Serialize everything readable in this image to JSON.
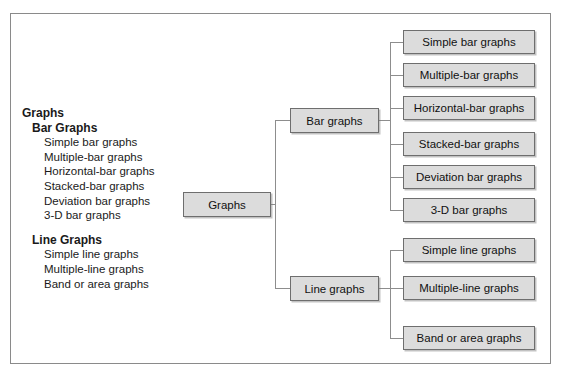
{
  "figure": {
    "border_color": "#8a8a8a",
    "node_fill": "#dcdcdc",
    "node_border": "#6e6e6e",
    "connector_color": "#8d8d8d",
    "background": "#ffffff"
  },
  "outline": {
    "lines": [
      {
        "level": 0,
        "text": "Graphs"
      },
      {
        "level": 1,
        "text": "Bar Graphs"
      },
      {
        "level": 2,
        "text": "Simple bar graphs"
      },
      {
        "level": 2,
        "text": "Multiple-bar graphs"
      },
      {
        "level": 2,
        "text": "Horizontal-bar graphs"
      },
      {
        "level": 2,
        "text": "Stacked-bar graphs"
      },
      {
        "level": 2,
        "text": "Deviation bar graphs"
      },
      {
        "level": 2,
        "text": "3-D bar graphs"
      },
      {
        "level": 1,
        "text": "Line Graphs",
        "gap_before": true
      },
      {
        "level": 2,
        "text": "Simple line graphs"
      },
      {
        "level": 2,
        "text": "Multiple-line graphs"
      },
      {
        "level": 2,
        "text": "Band or area graphs"
      }
    ]
  },
  "tree": {
    "root": {
      "label": "Graphs"
    },
    "branches": [
      {
        "label": "Bar graphs"
      },
      {
        "label": "Line graphs"
      }
    ],
    "leaves_bar": [
      {
        "label": "Simple bar graphs"
      },
      {
        "label": "Multiple-bar graphs"
      },
      {
        "label": "Horizontal-bar graphs"
      },
      {
        "label": "Stacked-bar graphs"
      },
      {
        "label": "Deviation bar graphs"
      },
      {
        "label": "3-D bar graphs"
      }
    ],
    "leaves_line": [
      {
        "label": "Simple line graphs"
      },
      {
        "label": "Multiple-line graphs"
      },
      {
        "label": "Band or area graphs"
      }
    ]
  }
}
